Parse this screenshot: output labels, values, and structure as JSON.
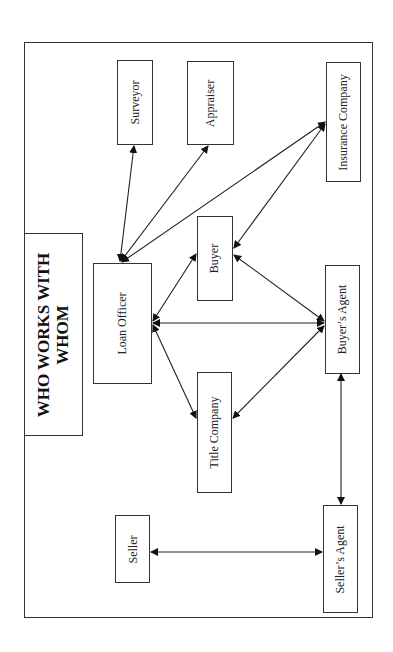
{
  "diagram": {
    "title_line1": "WHO WORKS WITH",
    "title_line2": "WHOM",
    "orientation": "rotated -90deg (landscape page shown in portrait)",
    "colors": {
      "stroke": "#333333",
      "text": "#222222",
      "background": "#ffffff"
    },
    "nodes": [
      {
        "id": "surveyor",
        "label": "Surveyor"
      },
      {
        "id": "appraiser",
        "label": "Appraiser"
      },
      {
        "id": "insurance_company",
        "label": "Insurance Company"
      },
      {
        "id": "loan_officer",
        "label": "Loan Officer"
      },
      {
        "id": "buyer",
        "label": "Buyer"
      },
      {
        "id": "buyers_agent",
        "label": "Buyer’s Agent"
      },
      {
        "id": "title_company",
        "label": "Title Company"
      },
      {
        "id": "seller",
        "label": "Seller"
      },
      {
        "id": "sellers_agent",
        "label": "Seller’s Agent"
      }
    ],
    "edges": [
      {
        "from": "loan_officer",
        "to": "surveyor",
        "bidirectional": true
      },
      {
        "from": "loan_officer",
        "to": "appraiser",
        "bidirectional": true
      },
      {
        "from": "loan_officer",
        "to": "insurance_company",
        "bidirectional": true
      },
      {
        "from": "insurance_company",
        "to": "buyer",
        "bidirectional": true
      },
      {
        "from": "loan_officer",
        "to": "buyer",
        "bidirectional": true
      },
      {
        "from": "loan_officer",
        "to": "buyers_agent",
        "bidirectional": true
      },
      {
        "from": "loan_officer",
        "to": "title_company",
        "bidirectional": true
      },
      {
        "from": "buyer",
        "to": "buyers_agent",
        "bidirectional": true
      },
      {
        "from": "title_company",
        "to": "buyers_agent",
        "bidirectional": true
      },
      {
        "from": "buyers_agent",
        "to": "sellers_agent",
        "bidirectional": true
      },
      {
        "from": "seller",
        "to": "sellers_agent",
        "bidirectional": true
      }
    ]
  }
}
